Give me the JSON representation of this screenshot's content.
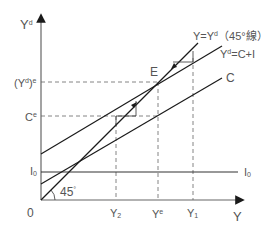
{
  "diagram": {
    "type": "keynesian-cross",
    "axes": {
      "y_label": "Y",
      "y_label_sup": "d",
      "x_label": "Y",
      "origin_label": "0"
    },
    "lines": {
      "line_45": {
        "label": "Y=Y",
        "label_sup": "d",
        "label_suffix": "（45°線）"
      },
      "aggregate_demand": {
        "label": "Y",
        "label_sup": "d",
        "label_suffix": "=C+I"
      },
      "consumption": {
        "label": "C"
      },
      "investment": {
        "label": "I",
        "label_sub": "0"
      }
    },
    "y_ticks": {
      "yde": {
        "prefix": "(Y",
        "sup1": "d",
        "mid": ")",
        "sup2": "e"
      },
      "ce": {
        "base": "C",
        "sup": "e"
      },
      "i0": {
        "base": "I",
        "sub": "0"
      }
    },
    "x_ticks": [
      {
        "base": "Y",
        "sub": "2"
      },
      {
        "base": "Y",
        "sup": "e"
      },
      {
        "base": "Y",
        "sub": "1"
      }
    ],
    "point_label": "E",
    "angle_label": "45",
    "angle_sup": "°",
    "colors": {
      "line": "#1a1a1a",
      "axis": "#555555",
      "dashed": "#555555",
      "text": "#555555"
    }
  }
}
